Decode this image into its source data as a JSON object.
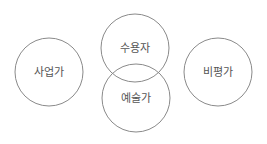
{
  "diagram": {
    "nodes": [
      {
        "id": "entrepreneur",
        "label": "사업가",
        "cx": 49,
        "cy": 72,
        "r": 34
      },
      {
        "id": "recipient",
        "label": "수용자",
        "cx": 135,
        "cy": 48,
        "r": 34
      },
      {
        "id": "artist",
        "label": "예술가",
        "cx": 136,
        "cy": 98,
        "r": 34
      },
      {
        "id": "critic",
        "label": "비평가",
        "cx": 218,
        "cy": 72,
        "r": 34
      }
    ],
    "colors": {
      "stroke": "#8a8a8a",
      "text": "#555555",
      "background": "#ffffff"
    }
  }
}
